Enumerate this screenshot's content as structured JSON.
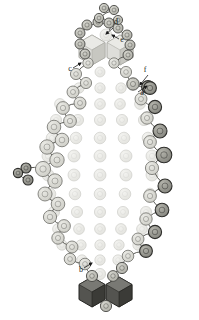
{
  "figure": {
    "type": "molecular-assembly-diagram",
    "background": "#ffffff",
    "width": 199,
    "height": 320
  },
  "palette": {
    "pale_fill": "#e8e8e4",
    "pale_stroke": "#cfcfca",
    "chain_fill": "#d8d8d2",
    "chain_stroke": "#6f6f6a",
    "mid_fill": "#b9b9b2",
    "mid_stroke": "#4a4a46",
    "dark_fill": "#8d8d86",
    "dark_stroke": "#2e2e2b",
    "hex_light_fill": "#dededa",
    "hex_light_top": "#ebebe7",
    "hex_light_side": "#c6c6c0",
    "hex_dark_fill": "#545450",
    "hex_dark_top": "#7b7b76",
    "hex_dark_side": "#3a3a36",
    "bond_stroke": "#5a5a55",
    "label_color": "#1a1a1a",
    "arrow_color": "#1a1a1a"
  },
  "labels": [
    {
      "id": "a",
      "text": "a",
      "x": 142,
      "y": 95,
      "anchor": "middle"
    },
    {
      "id": "b",
      "text": "b",
      "x": 81,
      "y": 272,
      "anchor": "middle"
    },
    {
      "id": "c",
      "text": "c",
      "x": 70,
      "y": 71,
      "anchor": "middle"
    },
    {
      "id": "d",
      "text": "d",
      "x": 116,
      "y": 24,
      "anchor": "middle"
    },
    {
      "id": "e",
      "text": "e",
      "x": 122,
      "y": 42,
      "anchor": "middle"
    },
    {
      "id": "f",
      "text": "f",
      "x": 145,
      "y": 72,
      "anchor": "middle"
    }
  ],
  "leader_lines": [
    {
      "for": "a",
      "x1": 138,
      "y1": 92,
      "x2": 147,
      "y2": 86,
      "arrow": true
    },
    {
      "for": "b",
      "x1": 84,
      "y1": 268,
      "x2": 92,
      "y2": 263,
      "arrow": true
    },
    {
      "for": "c",
      "x1": 73,
      "y1": 68,
      "x2": 81,
      "y2": 63,
      "arrow": true
    },
    {
      "for": "d",
      "x1": 113,
      "y1": 28,
      "x2": 106,
      "y2": 34,
      "arrow": true
    },
    {
      "for": "e",
      "x1": 119,
      "y1": 39,
      "x2": 112,
      "y2": 35,
      "arrow": true
    },
    {
      "for": "f",
      "x1": 148,
      "y1": 75,
      "x2": 140,
      "y2": 85,
      "arrow": true
    }
  ],
  "inner_rings": {
    "description": "Concentric pale circle rings filling the oval interior",
    "rows": [
      {
        "cy": 72,
        "cx": 100,
        "count": 1,
        "r": 5.0,
        "spacing": 0
      },
      {
        "cy": 88,
        "cx": 100,
        "count": 3,
        "r": 5.2,
        "spacing": 21
      },
      {
        "cy": 104,
        "cx": 100,
        "count": 5,
        "r": 5.4,
        "spacing": 20
      },
      {
        "cy": 120,
        "cx": 100,
        "count": 5,
        "r": 5.6,
        "spacing": 22
      },
      {
        "cy": 138,
        "cx": 100,
        "count": 5,
        "r": 5.8,
        "spacing": 24
      },
      {
        "cy": 156,
        "cx": 100,
        "count": 5,
        "r": 6.0,
        "spacing": 26
      },
      {
        "cy": 175,
        "cx": 100,
        "count": 5,
        "r": 6.0,
        "spacing": 26
      },
      {
        "cy": 194,
        "cx": 100,
        "count": 5,
        "r": 5.8,
        "spacing": 25
      },
      {
        "cy": 212,
        "cx": 100,
        "count": 5,
        "r": 5.6,
        "spacing": 23
      },
      {
        "cy": 229,
        "cx": 100,
        "count": 5,
        "r": 5.4,
        "spacing": 21
      },
      {
        "cy": 245,
        "cx": 100,
        "count": 5,
        "r": 5.2,
        "spacing": 19
      },
      {
        "cy": 260,
        "cx": 100,
        "count": 3,
        "r": 5.2,
        "spacing": 18
      },
      {
        "cy": 274,
        "cx": 100,
        "count": 1,
        "r": 5.6,
        "spacing": 0
      }
    ]
  },
  "chain": {
    "description": "Zigzag perimeter chain of shaded circles connected by bonds",
    "left_nodes": [
      {
        "x": 88,
        "y": 63,
        "r": 5.2,
        "tone": "chain"
      },
      {
        "x": 76,
        "y": 74,
        "r": 5.6,
        "tone": "chain"
      },
      {
        "x": 86,
        "y": 83,
        "r": 5.6,
        "tone": "chain"
      },
      {
        "x": 73,
        "y": 92,
        "r": 6.0,
        "tone": "chain"
      },
      {
        "x": 80,
        "y": 103,
        "r": 6.0,
        "tone": "chain"
      },
      {
        "x": 63,
        "y": 108,
        "r": 6.4,
        "tone": "chain"
      },
      {
        "x": 70,
        "y": 121,
        "r": 6.4,
        "tone": "chain"
      },
      {
        "x": 54,
        "y": 127,
        "r": 6.8,
        "tone": "chain"
      },
      {
        "x": 62,
        "y": 140,
        "r": 6.8,
        "tone": "chain"
      },
      {
        "x": 47,
        "y": 147,
        "r": 7.2,
        "tone": "chain"
      },
      {
        "x": 57,
        "y": 160,
        "r": 7.2,
        "tone": "chain"
      },
      {
        "x": 43,
        "y": 169,
        "r": 7.6,
        "tone": "chain"
      },
      {
        "x": 55,
        "y": 181,
        "r": 7.2,
        "tone": "chain"
      },
      {
        "x": 45,
        "y": 194,
        "r": 7.0,
        "tone": "chain"
      },
      {
        "x": 58,
        "y": 204,
        "r": 6.8,
        "tone": "chain"
      },
      {
        "x": 50,
        "y": 217,
        "r": 6.6,
        "tone": "chain"
      },
      {
        "x": 64,
        "y": 226,
        "r": 6.4,
        "tone": "chain"
      },
      {
        "x": 58,
        "y": 238,
        "r": 6.2,
        "tone": "chain"
      },
      {
        "x": 72,
        "y": 247,
        "r": 6.0,
        "tone": "chain"
      },
      {
        "x": 70,
        "y": 259,
        "r": 5.8,
        "tone": "chain"
      },
      {
        "x": 85,
        "y": 264,
        "r": 5.8,
        "tone": "chain"
      },
      {
        "x": 92,
        "y": 276,
        "r": 5.6,
        "tone": "mid"
      }
    ],
    "right_nodes": [
      {
        "x": 114,
        "y": 63,
        "r": 5.2,
        "tone": "chain"
      },
      {
        "x": 126,
        "y": 72,
        "r": 5.6,
        "tone": "chain"
      },
      {
        "x": 133,
        "y": 84,
        "r": 6.2,
        "tone": "mid"
      },
      {
        "x": 148,
        "y": 87,
        "r": 6.4,
        "tone": "dark"
      },
      {
        "x": 141,
        "y": 99,
        "r": 6.0,
        "tone": "chain"
      },
      {
        "x": 155,
        "y": 107,
        "r": 6.6,
        "tone": "dark"
      },
      {
        "x": 147,
        "y": 118,
        "r": 6.2,
        "tone": "chain"
      },
      {
        "x": 160,
        "y": 131,
        "r": 7.0,
        "tone": "dark"
      },
      {
        "x": 150,
        "y": 142,
        "r": 6.4,
        "tone": "chain"
      },
      {
        "x": 164,
        "y": 155,
        "r": 7.8,
        "tone": "dark"
      },
      {
        "x": 152,
        "y": 168,
        "r": 6.6,
        "tone": "chain"
      },
      {
        "x": 165,
        "y": 186,
        "r": 7.0,
        "tone": "dark"
      },
      {
        "x": 150,
        "y": 196,
        "r": 6.4,
        "tone": "chain"
      },
      {
        "x": 162,
        "y": 210,
        "r": 6.8,
        "tone": "dark"
      },
      {
        "x": 146,
        "y": 219,
        "r": 6.2,
        "tone": "chain"
      },
      {
        "x": 155,
        "y": 232,
        "r": 6.6,
        "tone": "dark"
      },
      {
        "x": 138,
        "y": 239,
        "r": 6.0,
        "tone": "chain"
      },
      {
        "x": 146,
        "y": 251,
        "r": 6.4,
        "tone": "dark"
      },
      {
        "x": 128,
        "y": 256,
        "r": 5.8,
        "tone": "chain"
      },
      {
        "x": 122,
        "y": 268,
        "r": 5.6,
        "tone": "mid"
      },
      {
        "x": 113,
        "y": 276,
        "r": 5.4,
        "tone": "mid"
      }
    ],
    "crown_nodes": [
      {
        "x": 85,
        "y": 54,
        "r": 5.0,
        "tone": "mid"
      },
      {
        "x": 80,
        "y": 44,
        "r": 5.0,
        "tone": "mid"
      },
      {
        "x": 80,
        "y": 33,
        "r": 5.0,
        "tone": "mid"
      },
      {
        "x": 87,
        "y": 25,
        "r": 5.0,
        "tone": "mid"
      },
      {
        "x": 98,
        "y": 22,
        "r": 5.0,
        "tone": "mid"
      },
      {
        "x": 109,
        "y": 23,
        "r": 5.0,
        "tone": "mid"
      },
      {
        "x": 118,
        "y": 28,
        "r": 5.0,
        "tone": "mid"
      },
      {
        "x": 127,
        "y": 35,
        "r": 5.0,
        "tone": "mid"
      },
      {
        "x": 130,
        "y": 45,
        "r": 5.0,
        "tone": "mid"
      },
      {
        "x": 128,
        "y": 55,
        "r": 5.0,
        "tone": "mid"
      }
    ],
    "apex_nodes": [
      {
        "x": 104,
        "y": 8,
        "r": 4.6,
        "tone": "mid"
      },
      {
        "x": 114,
        "y": 10,
        "r": 4.6,
        "tone": "mid"
      },
      {
        "x": 99,
        "y": 18,
        "r": 4.6,
        "tone": "mid"
      },
      {
        "x": 118,
        "y": 20,
        "r": 4.6,
        "tone": "mid"
      },
      {
        "x": 106,
        "y": 35,
        "r": 6.0,
        "tone": "pale"
      }
    ],
    "left_spur_nodes": [
      {
        "x": 26,
        "y": 168,
        "r": 5.0,
        "tone": "dark"
      },
      {
        "x": 18,
        "y": 173,
        "r": 4.6,
        "tone": "dark"
      },
      {
        "x": 28,
        "y": 180,
        "r": 5.0,
        "tone": "dark"
      }
    ],
    "right_spur_nodes": [
      {
        "x": 150,
        "y": 88,
        "r": 6.4,
        "tone": "dark"
      }
    ]
  },
  "hexagons": {
    "top": [
      {
        "cx": 92,
        "cy": 50,
        "r": 15,
        "tone": "light"
      },
      {
        "cx": 120,
        "cy": 50,
        "r": 15,
        "tone": "light"
      }
    ],
    "bottom": [
      {
        "cx": 92,
        "cy": 292,
        "r": 15,
        "tone": "dark"
      },
      {
        "cx": 119,
        "cy": 292,
        "r": 15,
        "tone": "dark"
      }
    ],
    "bottom_cap_node": {
      "x": 106,
      "y": 306,
      "r": 5.6,
      "tone": "mid"
    }
  },
  "bonds": {
    "description": "Wavy/zigzag connector strokes linking adjacent chain circles",
    "stroke_width": 1.0
  }
}
